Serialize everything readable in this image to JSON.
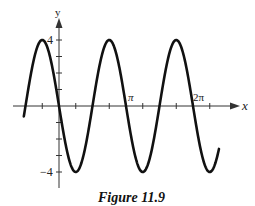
{
  "chart_data": {
    "type": "line",
    "title": "",
    "caption": "Figure 11.9",
    "function": "y = -4 sin(2x)",
    "xlabel": "x",
    "ylabel": "y",
    "x_tick_labels": [
      "π",
      "2π"
    ],
    "y_tick_labels": [
      "4",
      "−4"
    ],
    "xlim": [
      -1.7,
      8.2
    ],
    "ylim": [
      -5.0,
      5.2
    ],
    "amplitude": 4,
    "period": "π",
    "series": [
      {
        "name": "y = -4 sin 2x",
        "x": [
          -1.65,
          -0.785,
          0,
          0.785,
          1.571,
          2.356,
          3.142,
          3.927,
          4.712,
          5.498,
          6.283,
          7.069,
          7.5
        ],
        "y": [
          1.0,
          4,
          0,
          -4,
          0,
          4,
          0,
          -4,
          0,
          4,
          0,
          -4,
          -2.6
        ]
      }
    ],
    "grid": false,
    "legend": null
  },
  "labels": {
    "x_axis": "x",
    "y_axis": "y",
    "y_max": "4",
    "y_min": "−4",
    "pi": "π",
    "two_pi": "2π",
    "caption": "Figure 11.9"
  }
}
